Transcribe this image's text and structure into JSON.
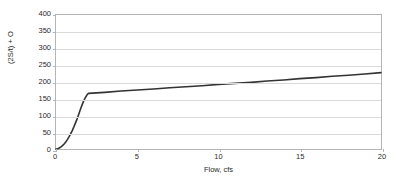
{
  "chart_data": {
    "type": "line",
    "title": "",
    "xlabel": "Flow, cfs",
    "ylabel": "(2S/t) + O",
    "xlim": [
      0,
      20
    ],
    "ylim": [
      0,
      400
    ],
    "xticks": [
      0,
      5,
      10,
      15,
      20
    ],
    "yticks": [
      0,
      50,
      100,
      150,
      200,
      250,
      300,
      350,
      400
    ],
    "grid": "horizontal",
    "legend": "none",
    "line_color": "#333333",
    "grid_color": "#d9d9d9",
    "axis_color": "#b5b5b5",
    "series": [
      {
        "name": "storage-indication",
        "x": [
          0.0,
          0.1,
          0.2,
          0.3,
          0.4,
          0.5,
          0.6,
          0.7,
          0.8,
          0.9,
          1.0,
          1.1,
          1.2,
          1.3,
          1.4,
          1.5,
          1.6,
          1.7,
          1.8,
          1.9,
          1.95,
          2.0,
          3.0,
          4.0,
          5.0,
          6.0,
          7.0,
          8.0,
          9.0,
          10.0,
          11.0,
          12.0,
          13.0,
          14.0,
          15.0,
          16.0,
          17.0,
          18.0,
          19.0,
          20.0
        ],
        "y": [
          0,
          1,
          3,
          6,
          10,
          15,
          21,
          28,
          36,
          45,
          55,
          66,
          78,
          90,
          104,
          118,
          131,
          143,
          153,
          161,
          164,
          166,
          169,
          173,
          176,
          179,
          183,
          186,
          189,
          193,
          196,
          199,
          203,
          206,
          210,
          213,
          217,
          220,
          224,
          228
        ]
      }
    ]
  }
}
